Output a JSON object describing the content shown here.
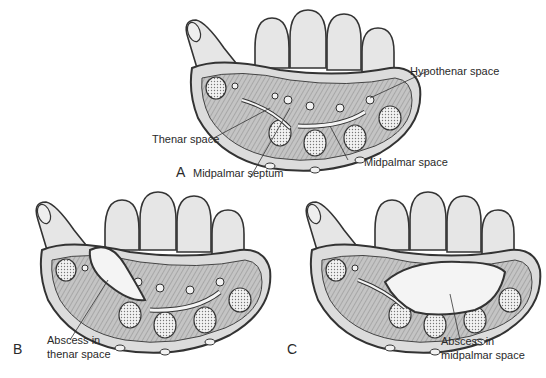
{
  "figure": {
    "panels": [
      {
        "letter": "A",
        "labels": {
          "hypothenar": "Hypothenar space",
          "thenar": "Thenar space",
          "septum": "Midpalmar septum",
          "midpalmar": "Midpalmar space"
        }
      },
      {
        "letter": "B",
        "labels": {
          "abscess_line1": "Abscess in",
          "abscess_line2": "thenar space"
        }
      },
      {
        "letter": "C",
        "labels": {
          "abscess_line1": "Abscess in",
          "abscess_line2": "midpalmar space"
        }
      }
    ],
    "colors": {
      "skin": "#e6e6e6",
      "outline": "#333333",
      "tissue": "#bdbdbd",
      "space": "#f4f4f4",
      "bone": "#f2f2f2"
    }
  }
}
